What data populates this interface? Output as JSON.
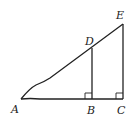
{
  "diagram": {
    "type": "geometry",
    "points": {
      "A": {
        "label": "A",
        "x": 21,
        "y": 99
      },
      "B": {
        "label": "B",
        "x": 92,
        "y": 99
      },
      "C": {
        "label": "C",
        "x": 123,
        "y": 99
      },
      "D": {
        "label": "D",
        "x": 92,
        "y": 48
      },
      "E": {
        "label": "E",
        "x": 123,
        "y": 24
      }
    },
    "segments": [
      "AC",
      "AE",
      "BD",
      "CE"
    ],
    "right_angles": [
      "B",
      "C"
    ],
    "stroke_color": "#222222"
  }
}
